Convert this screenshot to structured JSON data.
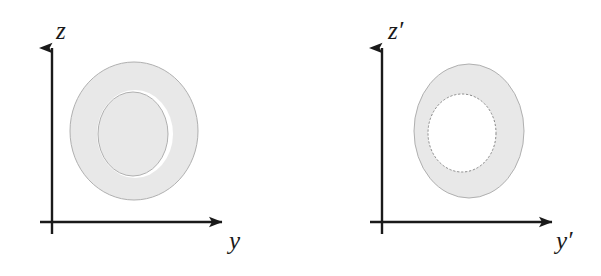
{
  "figure": {
    "background_color": "#ffffff",
    "stroke_color": "#1a1a1a",
    "shade_fill_color": "#e8e8e8",
    "shade_outline_color": "#a8a8a8",
    "inner_hole_color": "#ffffff",
    "width": 601,
    "height": 276
  },
  "panels": [
    {
      "id": "panel-unprimed",
      "name": "left-panel",
      "origin": {
        "x": 52,
        "y": 222
      },
      "vertical_axis": {
        "name": "z-axis",
        "label": "z",
        "label_position": {
          "x": 56,
          "y": 18
        },
        "tip": {
          "x": 52,
          "y": 42
        },
        "tail": {
          "x": 52,
          "y": 234
        },
        "arrow": "up"
      },
      "horizontal_axis": {
        "name": "y-axis",
        "label": "y",
        "label_position": {
          "x": 229,
          "y": 228
        },
        "tip": {
          "x": 228,
          "y": 222
        },
        "tail": {
          "x": 40,
          "y": 222
        },
        "arrow": "right"
      },
      "shape": {
        "type": "torus-cross-section-shaded-disk",
        "outer_ellipse": {
          "cx": 134,
          "cy": 131,
          "rx": 64,
          "ry": 69
        },
        "inner_ellipse": {
          "cx": 133,
          "cy": 134,
          "rx": 35,
          "ry": 42
        },
        "gap_ring": "thin white crescent separating outer shaded disk from inner shaded ellipse, open at left and right"
      }
    },
    {
      "id": "panel-primed",
      "name": "right-panel",
      "origin": {
        "x": 382,
        "y": 222
      },
      "vertical_axis": {
        "name": "z-prime-axis",
        "label": "z′",
        "label_position": {
          "x": 388,
          "y": 18
        },
        "tip": {
          "x": 382,
          "y": 42
        },
        "tail": {
          "x": 382,
          "y": 234
        },
        "arrow": "up"
      },
      "horizontal_axis": {
        "name": "y-prime-axis",
        "label": "y′",
        "label_position": {
          "x": 556,
          "y": 228
        },
        "tip": {
          "x": 558,
          "y": 222
        },
        "tail": {
          "x": 370,
          "y": 222
        },
        "arrow": "right"
      },
      "shape": {
        "type": "annulus-shaded-ring",
        "outer_ellipse": {
          "cx": 469,
          "cy": 131,
          "rx": 55,
          "ry": 67
        },
        "inner_ellipse": {
          "cx": 462,
          "cy": 133,
          "rx": 34,
          "ry": 39
        },
        "hole": "white elliptical hole offset toward the upper-left of the ring"
      }
    }
  ],
  "labels": {
    "z": "z",
    "y": "y",
    "z_prime": "z′",
    "y_prime": "y′"
  }
}
